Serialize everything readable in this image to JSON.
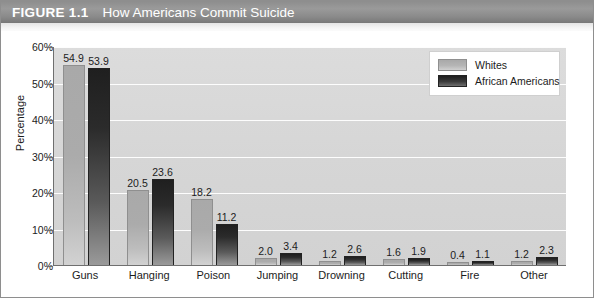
{
  "figure": {
    "number_label": "FIGURE 1.1",
    "title": "How Americans Commit Suicide"
  },
  "legend": {
    "position": "top-right",
    "entries": [
      {
        "label": "Whites",
        "color": "#a9a9a9"
      },
      {
        "label": "African Americans",
        "color": "#1f1f1f"
      }
    ]
  },
  "axes": {
    "ylabel": "Percentage",
    "yticks": [
      "0%",
      "10%",
      "20%",
      "30%",
      "40%",
      "50%",
      "60%"
    ]
  },
  "chart_data": {
    "type": "bar",
    "title": "How Americans Commit Suicide",
    "xlabel": "",
    "ylabel": "Percentage",
    "ylim": [
      0,
      60
    ],
    "ytick_step": 10,
    "grid": true,
    "legend_position": "top-right",
    "categories": [
      "Guns",
      "Hanging",
      "Poison",
      "Jumping",
      "Drowning",
      "Cutting",
      "Fire",
      "Other"
    ],
    "series": [
      {
        "name": "Whites",
        "color": "#a9a9a9",
        "values": [
          54.9,
          20.5,
          18.2,
          2.0,
          1.2,
          1.6,
          0.4,
          1.2
        ],
        "labels": [
          "54.9",
          "20.5",
          "18.2",
          "2.0",
          "1.2",
          "1.6",
          "0.4",
          "1.2"
        ]
      },
      {
        "name": "African Americans",
        "color": "#1f1f1f",
        "values": [
          53.9,
          23.6,
          11.2,
          3.4,
          2.6,
          1.9,
          1.1,
          2.3
        ],
        "labels": [
          "53.9",
          "23.6",
          "11.2",
          "3.4",
          "2.6",
          "1.9",
          "1.1",
          "2.3"
        ]
      }
    ]
  }
}
